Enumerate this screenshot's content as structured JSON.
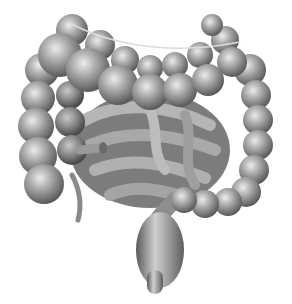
{
  "image": {
    "subject": "Anatomical illustration of the large and small intestine",
    "style": "grayscale shaded drawing",
    "background_color": "#ffffff",
    "tone_colors": {
      "highlight": "#e6e6e6",
      "mid": "#9a9a9a",
      "shadow": "#4a4a4a"
    },
    "parts": [
      "ascending-colon",
      "transverse-colon",
      "descending-colon",
      "sigmoid-colon",
      "rectum",
      "small-intestine",
      "appendix",
      "terminal-ileum"
    ]
  }
}
